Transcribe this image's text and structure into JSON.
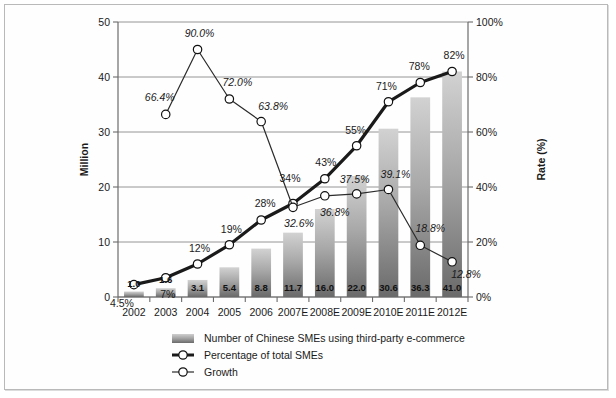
{
  "chart_data": {
    "type": "bar",
    "title": "",
    "subtitle": "",
    "xlabel": "",
    "ylabel": "Million",
    "y2label": "Rate (%)",
    "categories": [
      "2002",
      "2003",
      "2004",
      "2005",
      "2006",
      "2007E",
      "2008E",
      "2009E",
      "2010E",
      "2011E",
      "2012E"
    ],
    "ylim": [
      0,
      50
    ],
    "yticks": [
      "0",
      "10",
      "20",
      "30",
      "40",
      "50"
    ],
    "ytick_values": [
      0,
      10,
      20,
      30,
      40,
      50
    ],
    "y2lim": [
      0,
      100
    ],
    "y2ticks": [
      "0%",
      "20%",
      "40%",
      "60%",
      "80%",
      "100%"
    ],
    "y2tick_values": [
      0,
      20,
      40,
      60,
      80,
      100
    ],
    "grid": true,
    "legend_position": "bottom",
    "series": [
      {
        "name": "Number of Chinese SMEs using third-party e-commerce",
        "type": "bar",
        "axis": "left",
        "values": [
          1.0,
          1.6,
          3.1,
          5.4,
          8.8,
          11.7,
          16.0,
          22.0,
          30.6,
          36.3,
          41.0
        ],
        "labels": [
          "1.0",
          "1.6",
          "3.1",
          "5.4",
          "8.8",
          "11.7",
          "16.0",
          "22.0",
          "30.6",
          "36.3",
          "41.0"
        ]
      },
      {
        "name": "Percentage of total SMEs",
        "type": "line",
        "axis": "right",
        "values": [
          4.5,
          7,
          12,
          19,
          28,
          34,
          43,
          55,
          71,
          78,
          82
        ],
        "labels": [
          "4.5%",
          "7%",
          "12%",
          "19%",
          "28%",
          "34%",
          "43%",
          "55%",
          "71%",
          "78%",
          "82%"
        ]
      },
      {
        "name": "Growth",
        "type": "line",
        "axis": "right",
        "values": [
          null,
          66.4,
          90.0,
          72.0,
          63.8,
          32.6,
          36.8,
          37.5,
          39.1,
          18.8,
          12.8
        ],
        "labels": [
          null,
          "66.4%",
          "90.0%",
          "72.0%",
          "63.8%",
          "32.6%",
          "36.8%",
          "37.5%",
          "39.1%",
          "18.8%",
          "12.8%"
        ]
      }
    ],
    "colors": {
      "bar_top": "#c9c9c9",
      "bar_bottom": "#6e6e6e",
      "line_percentage": "#1a1a1a",
      "line_growth": "#2b2b2b",
      "grid": "#8a8a8a",
      "axis": "#6b6b6b",
      "text": "#1a1a1a",
      "frame": "#b9b9b9",
      "background": "#ffffff",
      "marker_fill": "#ffffff"
    }
  },
  "legend": {
    "items": [
      {
        "label": "Number of Chinese SMEs using third-party e-commerce",
        "marker": "bar-swatch"
      },
      {
        "label": "Percentage of total SMEs",
        "marker": "thick-line-circle"
      },
      {
        "label": "Growth",
        "marker": "thin-line-circle"
      }
    ]
  }
}
